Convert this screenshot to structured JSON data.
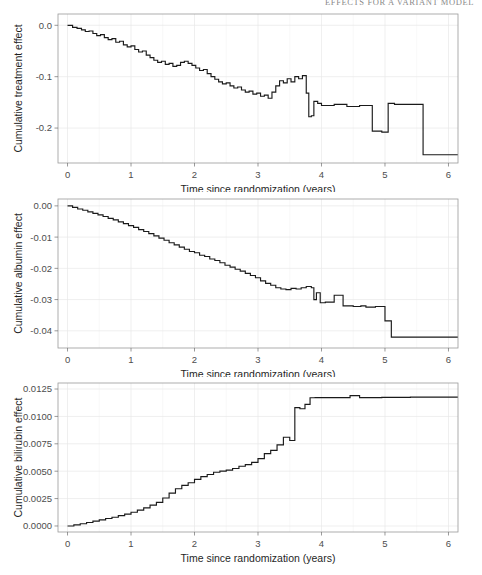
{
  "header": {
    "running_title": "EFFECTS FOR A VARIANT MODEL"
  },
  "shared": {
    "xlabel": "Time since randomization (years)",
    "x_ticks": [
      "0",
      "1",
      "2",
      "3",
      "4",
      "5",
      "6"
    ],
    "xlim": [
      -0.15,
      6.15
    ],
    "line_color": "#1a1a1a",
    "grid_color": "#e8e8e8",
    "border_color": "#9a9a9a"
  },
  "chart_data": [
    {
      "id": "treatment",
      "type": "line",
      "step": true,
      "title": "",
      "xlabel": "Time since randomization (years)",
      "ylabel": "Cumulative treatment effect",
      "xlim": [
        -0.15,
        6.15
      ],
      "ylim": [
        -0.268,
        0.022
      ],
      "x_ticks": [
        0,
        1,
        2,
        3,
        4,
        5,
        6
      ],
      "x_tick_labels": [
        "0",
        "1",
        "2",
        "3",
        "4",
        "5",
        "6"
      ],
      "y_ticks": [
        0.0,
        -0.1,
        -0.2
      ],
      "y_tick_labels": [
        "0.0",
        "-0.1",
        "-0.2"
      ],
      "grid": true,
      "x": [
        0.0,
        0.08,
        0.15,
        0.22,
        0.28,
        0.34,
        0.4,
        0.46,
        0.52,
        0.58,
        0.64,
        0.7,
        0.76,
        0.82,
        0.88,
        0.94,
        1.0,
        1.06,
        1.12,
        1.18,
        1.24,
        1.3,
        1.36,
        1.42,
        1.48,
        1.54,
        1.6,
        1.66,
        1.72,
        1.78,
        1.84,
        1.9,
        1.96,
        2.02,
        2.08,
        2.14,
        2.2,
        2.26,
        2.32,
        2.38,
        2.44,
        2.5,
        2.56,
        2.62,
        2.68,
        2.74,
        2.8,
        2.86,
        2.92,
        2.98,
        3.04,
        3.1,
        3.16,
        3.22,
        3.28,
        3.34,
        3.4,
        3.46,
        3.52,
        3.58,
        3.64,
        3.7,
        3.76,
        3.8,
        3.84,
        3.88,
        3.94,
        4.0,
        4.2,
        4.4,
        4.6,
        4.8,
        4.95,
        5.05,
        5.15,
        5.6,
        5.95
      ],
      "y": [
        0.0,
        -0.004,
        -0.006,
        -0.009,
        -0.012,
        -0.011,
        -0.016,
        -0.02,
        -0.018,
        -0.024,
        -0.028,
        -0.026,
        -0.033,
        -0.031,
        -0.038,
        -0.042,
        -0.04,
        -0.047,
        -0.052,
        -0.05,
        -0.058,
        -0.063,
        -0.068,
        -0.072,
        -0.07,
        -0.076,
        -0.074,
        -0.08,
        -0.078,
        -0.072,
        -0.07,
        -0.074,
        -0.078,
        -0.083,
        -0.088,
        -0.086,
        -0.094,
        -0.1,
        -0.105,
        -0.11,
        -0.114,
        -0.112,
        -0.118,
        -0.122,
        -0.12,
        -0.126,
        -0.13,
        -0.128,
        -0.134,
        -0.132,
        -0.138,
        -0.136,
        -0.142,
        -0.13,
        -0.118,
        -0.108,
        -0.112,
        -0.104,
        -0.11,
        -0.1,
        -0.104,
        -0.098,
        -0.132,
        -0.178,
        -0.176,
        -0.148,
        -0.152,
        -0.156,
        -0.154,
        -0.158,
        -0.156,
        -0.206,
        -0.208,
        -0.152,
        -0.154,
        -0.252,
        -0.252
      ]
    },
    {
      "id": "albumin",
      "type": "line",
      "step": true,
      "title": "",
      "xlabel": "Time since randomization (years)",
      "ylabel": "Cumulative albumin effect",
      "xlim": [
        -0.15,
        6.15
      ],
      "ylim": [
        -0.0455,
        0.0022
      ],
      "x_ticks": [
        0,
        1,
        2,
        3,
        4,
        5,
        6
      ],
      "x_tick_labels": [
        "0",
        "1",
        "2",
        "3",
        "4",
        "5",
        "6"
      ],
      "y_ticks": [
        0.0,
        -0.01,
        -0.02,
        -0.03,
        -0.04
      ],
      "y_tick_labels": [
        "0.00",
        "-0.01",
        "-0.02",
        "-0.03",
        "-0.04"
      ],
      "grid": true,
      "x": [
        0.0,
        0.08,
        0.16,
        0.24,
        0.32,
        0.4,
        0.48,
        0.56,
        0.64,
        0.72,
        0.8,
        0.88,
        0.96,
        1.04,
        1.12,
        1.2,
        1.28,
        1.36,
        1.44,
        1.52,
        1.6,
        1.68,
        1.76,
        1.84,
        1.92,
        2.0,
        2.08,
        2.16,
        2.24,
        2.32,
        2.4,
        2.48,
        2.56,
        2.64,
        2.72,
        2.8,
        2.88,
        2.96,
        3.04,
        3.12,
        3.2,
        3.28,
        3.36,
        3.44,
        3.52,
        3.6,
        3.68,
        3.76,
        3.84,
        3.88,
        3.92,
        3.98,
        4.06,
        4.2,
        4.34,
        4.5,
        4.62,
        4.7,
        4.85,
        5.0,
        5.1,
        5.4,
        5.95
      ],
      "y": [
        0.0,
        -0.0005,
        -0.001,
        -0.0014,
        -0.0019,
        -0.0024,
        -0.0029,
        -0.0034,
        -0.004,
        -0.0045,
        -0.0051,
        -0.0057,
        -0.0063,
        -0.0069,
        -0.0076,
        -0.0082,
        -0.0089,
        -0.0096,
        -0.0103,
        -0.011,
        -0.0118,
        -0.0125,
        -0.0132,
        -0.0139,
        -0.0146,
        -0.015,
        -0.0158,
        -0.0162,
        -0.017,
        -0.0175,
        -0.0182,
        -0.019,
        -0.0196,
        -0.0203,
        -0.0209,
        -0.0216,
        -0.0223,
        -0.023,
        -0.024,
        -0.0248,
        -0.0254,
        -0.0262,
        -0.0266,
        -0.0268,
        -0.0264,
        -0.0266,
        -0.0262,
        -0.0258,
        -0.0262,
        -0.03,
        -0.0278,
        -0.031,
        -0.0308,
        -0.0286,
        -0.032,
        -0.0322,
        -0.032,
        -0.0324,
        -0.0322,
        -0.0368,
        -0.042,
        -0.042,
        -0.042
      ]
    },
    {
      "id": "bilirubin",
      "type": "line",
      "step": true,
      "title": "",
      "xlabel": "Time since randomization (years)",
      "ylabel": "Cumulative bilirubin effect",
      "xlim": [
        -0.15,
        6.15
      ],
      "ylim": [
        -0.00055,
        0.01305
      ],
      "x_ticks": [
        0,
        1,
        2,
        3,
        4,
        5,
        6
      ],
      "x_tick_labels": [
        "0",
        "1",
        "2",
        "3",
        "4",
        "5",
        "6"
      ],
      "y_ticks": [
        0.0,
        0.0025,
        0.005,
        0.0075,
        0.01,
        0.0125
      ],
      "y_tick_labels": [
        "0.0000",
        "0.0025",
        "0.0050",
        "0.0075",
        "0.0100",
        "0.0125"
      ],
      "grid": true,
      "x": [
        0.0,
        0.1,
        0.2,
        0.3,
        0.4,
        0.5,
        0.6,
        0.7,
        0.8,
        0.9,
        1.0,
        1.1,
        1.2,
        1.3,
        1.4,
        1.5,
        1.6,
        1.7,
        1.8,
        1.9,
        2.0,
        2.1,
        2.2,
        2.3,
        2.4,
        2.5,
        2.6,
        2.7,
        2.8,
        2.9,
        3.0,
        3.1,
        3.2,
        3.3,
        3.4,
        3.5,
        3.58,
        3.66,
        3.74,
        3.82,
        3.9,
        4.0,
        4.2,
        4.45,
        4.6,
        4.75,
        4.95,
        5.1,
        5.4,
        5.95
      ],
      "y": [
        0.0,
        0.0001,
        0.0002,
        0.00032,
        0.00044,
        0.00056,
        0.00068,
        0.0008,
        0.00094,
        0.00108,
        0.00125,
        0.00145,
        0.00165,
        0.0019,
        0.00215,
        0.00255,
        0.003,
        0.0034,
        0.0037,
        0.00395,
        0.00425,
        0.0045,
        0.0047,
        0.0049,
        0.005,
        0.0051,
        0.00525,
        0.00545,
        0.0056,
        0.0058,
        0.00615,
        0.0066,
        0.0069,
        0.0074,
        0.0081,
        0.0078,
        0.0108,
        0.0107,
        0.0111,
        0.0117,
        0.01172,
        0.01172,
        0.01172,
        0.0119,
        0.01172,
        0.01172,
        0.01174,
        0.01174,
        0.01176,
        0.01176
      ]
    }
  ]
}
